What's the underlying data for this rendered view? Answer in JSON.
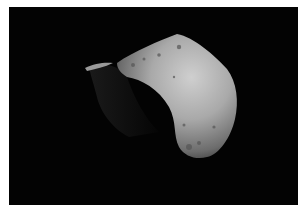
{
  "image": {
    "subject": "asteroid",
    "background_color": "#030303",
    "border_color": "#ffffff",
    "surface_highlight": "#c8c8c8",
    "surface_shadow": "#3a3a3a"
  }
}
